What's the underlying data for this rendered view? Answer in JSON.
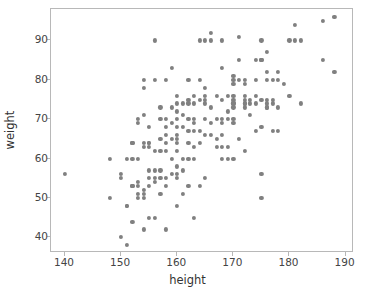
{
  "figure": {
    "background_color": "#ffffff",
    "plot_background_color": "#ffffff",
    "frame_color": "#b8b8b8"
  },
  "chart_data": {
    "type": "scatter",
    "title": "",
    "xlabel": "height",
    "ylabel": "weight",
    "xlim": [
      137.5,
      191.5
    ],
    "ylim": [
      36.0,
      98.0
    ],
    "xticks": [
      140,
      150,
      160,
      170,
      180,
      190
    ],
    "yticks": [
      40,
      50,
      60,
      70,
      80,
      90
    ],
    "xtick_labels": [
      "140",
      "150",
      "160",
      "170",
      "180",
      "190"
    ],
    "ytick_labels": [
      "40",
      "50",
      "60",
      "70",
      "80",
      "90"
    ],
    "grid": false,
    "legend": null,
    "marker": {
      "shape": "circle",
      "color": "#808080",
      "size_px": 4.2,
      "opacity": 1
    },
    "series": [
      {
        "name": "height-weight",
        "x": [
          140,
          148,
          148,
          150,
          150,
          150,
          151,
          151,
          151,
          151,
          152,
          152,
          152,
          152,
          152,
          152,
          153,
          153,
          153,
          153,
          153,
          153,
          153,
          154,
          154,
          154,
          154,
          154,
          154,
          154,
          154,
          154,
          155,
          155,
          155,
          155,
          155,
          155,
          155,
          155,
          156,
          156,
          156,
          156,
          156,
          156,
          156,
          157,
          157,
          157,
          157,
          157,
          157,
          157,
          158,
          158,
          158,
          158,
          158,
          158,
          158,
          158,
          158,
          159,
          159,
          159,
          159,
          159,
          159,
          160,
          160,
          160,
          160,
          160,
          160,
          160,
          160,
          160,
          160,
          160,
          160,
          160,
          161,
          161,
          161,
          161,
          161,
          161,
          162,
          162,
          162,
          162,
          162,
          162,
          162,
          162,
          163,
          163,
          163,
          163,
          163,
          163,
          163,
          163,
          164,
          164,
          164,
          164,
          164,
          164,
          165,
          165,
          165,
          165,
          165,
          165,
          165,
          165,
          166,
          166,
          166,
          166,
          166,
          167,
          167,
          167,
          167,
          168,
          168,
          168,
          168,
          168,
          168,
          168,
          168,
          169,
          169,
          169,
          169,
          169,
          170,
          170,
          170,
          170,
          170,
          170,
          170,
          170,
          170,
          170,
          170,
          171,
          171,
          171,
          171,
          172,
          172,
          172,
          172,
          172,
          172,
          172,
          172,
          173,
          173,
          173,
          174,
          174,
          174,
          174,
          174,
          175,
          175,
          175,
          175,
          175,
          175,
          175,
          176,
          176,
          176,
          176,
          176,
          176,
          176,
          177,
          177,
          177,
          177,
          178,
          178,
          178,
          178,
          179,
          180,
          180,
          181,
          181,
          182,
          182,
          186,
          186,
          188,
          188
        ],
        "y": [
          56,
          60,
          50,
          55,
          56,
          40,
          48,
          48,
          38,
          60,
          64,
          64,
          60,
          53,
          53,
          44,
          69,
          70,
          60,
          54,
          53,
          51,
          50,
          78,
          80,
          71,
          64,
          63,
          52,
          51,
          50,
          42,
          68,
          64,
          64,
          63,
          57,
          55,
          53,
          45,
          90,
          80,
          62,
          57,
          55,
          54,
          45,
          73,
          70,
          65,
          62,
          57,
          55,
          51,
          80,
          70,
          68,
          66,
          64,
          62,
          55,
          53,
          42,
          83,
          73,
          69,
          65,
          60,
          56,
          76,
          74,
          72,
          70,
          68,
          66,
          65,
          64,
          62,
          58,
          56,
          55,
          48,
          74,
          71,
          68,
          60,
          57,
          51,
          80,
          75,
          74,
          70,
          67,
          64,
          60,
          53,
          76,
          74,
          70,
          69,
          67,
          63,
          60,
          45,
          90,
          80,
          75,
          67,
          64,
          53,
          90,
          78,
          76,
          75,
          74,
          70,
          66,
          55,
          92,
          90,
          73,
          69,
          66,
          76,
          70,
          65,
          63,
          90,
          83,
          75,
          70,
          69,
          66,
          63,
          60,
          76,
          72,
          70,
          63,
          60,
          81,
          80,
          79,
          76,
          75,
          74,
          74,
          73,
          70,
          69,
          60,
          91,
          85,
          80,
          65,
          80,
          79,
          76,
          75,
          74,
          74,
          73,
          62,
          75,
          74,
          71,
          85,
          80,
          76,
          74,
          67,
          90,
          85,
          85,
          75,
          68,
          56,
          50,
          87,
          82,
          80,
          75,
          74,
          73,
          73,
          80,
          75,
          74,
          67,
          82,
          80,
          73,
          67,
          79,
          90,
          76,
          94,
          90,
          90,
          74,
          95,
          85,
          96,
          82
        ]
      }
    ]
  }
}
